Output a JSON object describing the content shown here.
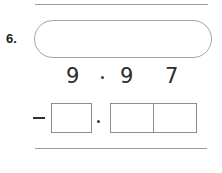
{
  "problem": {
    "number_label": "6.",
    "rules": {
      "top_label": "top-divider",
      "bottom_label": "bottom-divider"
    },
    "bubble": {
      "label": "answer-bubble",
      "content": ""
    },
    "printed_expression": {
      "whole_part": "9",
      "decimal_separator": ".",
      "tenths": "9",
      "hundredths": "7",
      "full_text": "9.97"
    },
    "work_row": {
      "operator": "−",
      "operator_name": "minus",
      "whole_box_value": "",
      "decimal_separator": ".",
      "tenths_box_value": "",
      "hundredths_box_value": ""
    },
    "colors": {
      "rule": "#9a9a9a",
      "outline": "#8d8d8d",
      "bubble_outline": "#a5a5a5",
      "ink": "#2b2b2b",
      "background": "#ffffff"
    }
  }
}
